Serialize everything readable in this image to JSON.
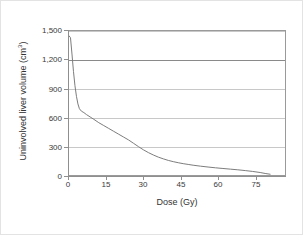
{
  "chart_data": {
    "type": "line",
    "title": "",
    "xlabel": "Dose (Gy)",
    "ylabel": "Uninvolved liver volume (cm³)",
    "ylabel_text": "Uninvolved liver volume (cm",
    "ylabel_sup": "3",
    "ylabel_close": ")",
    "xlim": [
      0,
      87
    ],
    "ylim": [
      0,
      1500
    ],
    "xticks": [
      0,
      15,
      30,
      45,
      60,
      75
    ],
    "xtick_labels": [
      "0",
      "15",
      "30",
      "45",
      "60",
      "75"
    ],
    "yticks": [
      0,
      300,
      600,
      900,
      1200,
      1500
    ],
    "ytick_labels": [
      "0",
      "300",
      "600",
      "900",
      "1,200",
      "1,500"
    ],
    "grid": "horizontal",
    "gridlines": [
      {
        "value": 1500,
        "style": "light"
      },
      {
        "value": 1200,
        "style": "strong"
      },
      {
        "value": 900,
        "style": "light"
      },
      {
        "value": 600,
        "style": "light"
      },
      {
        "value": 300,
        "style": "light"
      },
      {
        "value": 0,
        "style": "light"
      }
    ],
    "legend": "none",
    "series": [
      {
        "name": "Uninvolved liver dose-volume histogram",
        "color": "#7a7a7a",
        "line_width": 1,
        "x": [
          0,
          0.6,
          1.2,
          1.8,
          2.4,
          3.0,
          3.6,
          4.2,
          5.0,
          6.0,
          7.0,
          8.5,
          10,
          12,
          14,
          16,
          18,
          20,
          22,
          24,
          26,
          28,
          30,
          32,
          34,
          36,
          38,
          40,
          42,
          44,
          46,
          48,
          50,
          53,
          56,
          59,
          62,
          65,
          68,
          71,
          74,
          77,
          79,
          81
        ],
        "y": [
          1450,
          1430,
          1260,
          1080,
          930,
          820,
          740,
          690,
          665,
          650,
          630,
          605,
          580,
          545,
          515,
          485,
          455,
          425,
          395,
          365,
          330,
          295,
          262,
          233,
          208,
          186,
          168,
          152,
          139,
          128,
          118,
          110,
          102,
          92,
          83,
          75,
          68,
          61,
          54,
          46,
          37,
          26,
          16,
          8
        ]
      }
    ]
  },
  "axis": {
    "x_title": "Dose (Gy)"
  }
}
